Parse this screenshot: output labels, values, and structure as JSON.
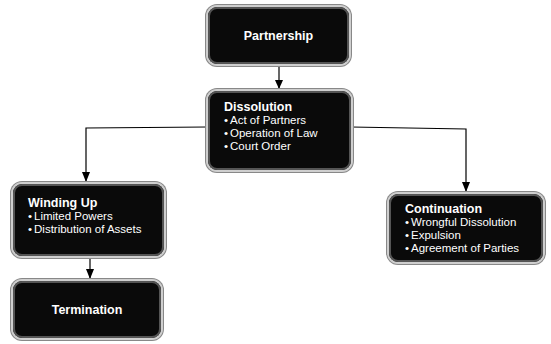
{
  "diagram": {
    "nodes": {
      "partnership": {
        "title": "Partnership"
      },
      "dissolution": {
        "title": "Dissolution",
        "items": [
          "Act of Partners",
          "Operation of Law",
          "Court Order"
        ]
      },
      "winding_up": {
        "title": "Winding Up",
        "items": [
          "Limited Powers",
          "Distribution of Assets"
        ]
      },
      "continuation": {
        "title": "Continuation",
        "items": [
          "Wrongful Dissolution",
          "Expulsion",
          "Agreement of Parties"
        ]
      },
      "termination": {
        "title": "Termination"
      }
    },
    "edges": [
      {
        "from": "Partnership",
        "to": "Dissolution"
      },
      {
        "from": "Dissolution",
        "to": "Winding Up"
      },
      {
        "from": "Dissolution",
        "to": "Continuation"
      },
      {
        "from": "Winding Up",
        "to": "Termination"
      }
    ],
    "colors": {
      "box_fill": "#0a0a0a",
      "box_text": "#ffffff",
      "line": "#000000"
    }
  }
}
